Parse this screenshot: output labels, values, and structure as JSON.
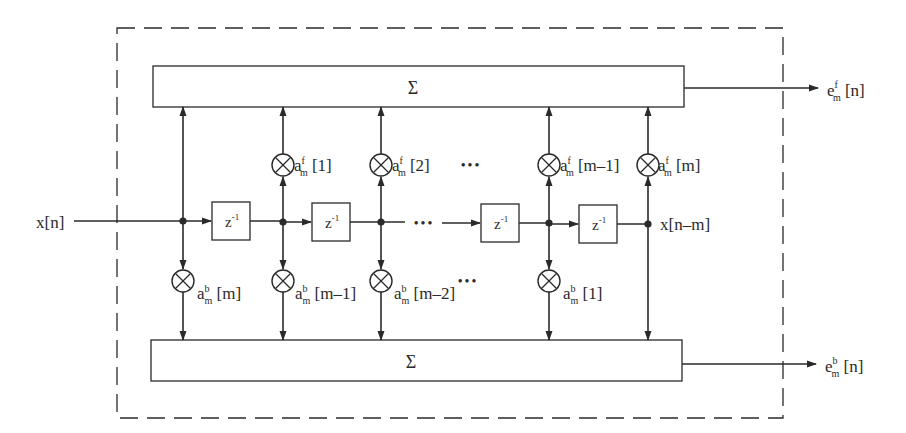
{
  "diagram": {
    "input_label": "x[n]",
    "delayed_output_label": "x[n–m]",
    "delay_label": {
      "base": "z",
      "exp": "-1"
    },
    "sum_top": {
      "symbol": "Σ"
    },
    "sum_bottom": {
      "symbol": "Σ"
    },
    "output_forward": {
      "base": "e",
      "sup": "f",
      "sub": "m",
      "arg": " [n]"
    },
    "output_backward": {
      "base": "e",
      "sup": "b",
      "sub": "m",
      "arg": " [n]"
    },
    "forward_coeffs": [
      {
        "base": "a",
        "sup": "f",
        "sub": "m",
        "arg": " [1]"
      },
      {
        "base": "a",
        "sup": "f",
        "sub": "m",
        "arg": " [2]"
      },
      {
        "base": "a",
        "sup": "f",
        "sub": "m",
        "arg": " [m–1]"
      },
      {
        "base": "a",
        "sup": "f",
        "sub": "m",
        "arg": " [m]"
      }
    ],
    "backward_coeffs": [
      {
        "base": "a",
        "sup": "b",
        "sub": "m",
        "arg": " [m]"
      },
      {
        "base": "a",
        "sup": "b",
        "sub": "m",
        "arg": " [m–1]"
      },
      {
        "base": "a",
        "sup": "b",
        "sub": "m",
        "arg": " [m–2]"
      },
      {
        "base": "a",
        "sup": "b",
        "sub": "m",
        "arg": " [1]"
      }
    ],
    "ellipsis": "•••",
    "multiplier_icon": "circle-cross-multiplier",
    "colors": {
      "stroke": "#2a2a2a",
      "background": "#ffffff"
    }
  }
}
